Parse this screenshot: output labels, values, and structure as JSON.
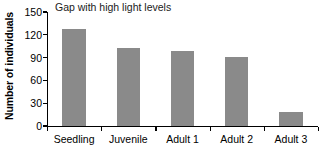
{
  "chart_data": {
    "type": "bar",
    "title": "Gap with high light levels",
    "xlabel": "",
    "ylabel": "Number of individuals",
    "categories": [
      "Seedling",
      "Juvenile",
      "Adult 1",
      "Adult 2",
      "Adult 3"
    ],
    "values": [
      127,
      102,
      99,
      91,
      18
    ],
    "ylim": [
      0,
      150
    ],
    "yticks": [
      0,
      30,
      60,
      90,
      120,
      150
    ],
    "ytick_labels": [
      "0",
      "30",
      "60",
      "90",
      "120",
      "150"
    ],
    "grid": false,
    "legend": null,
    "bar_color": "#8a8a8a",
    "axis_color": "#000000",
    "background_color": "#ffffff"
  }
}
